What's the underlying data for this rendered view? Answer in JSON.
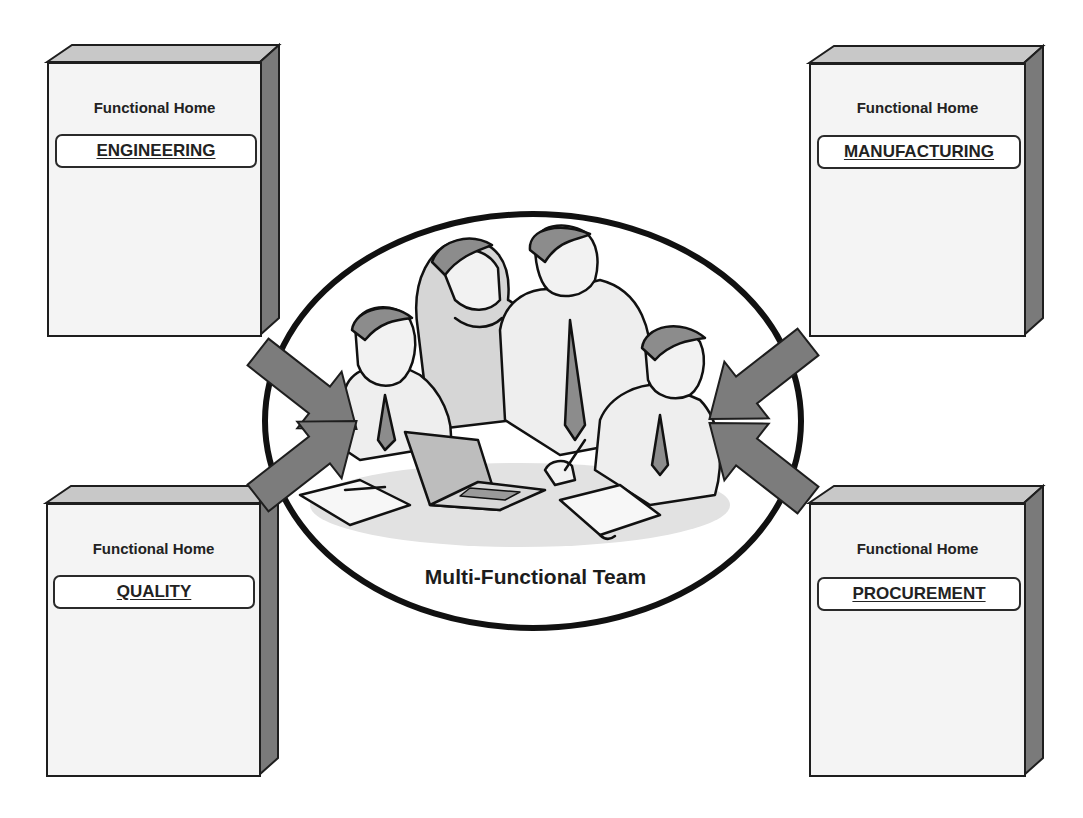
{
  "diagram": {
    "center": {
      "label": "Multi-Functional Team",
      "illustration": "team-meeting-clipart"
    },
    "functional_homes": [
      {
        "position": "top-left",
        "caption": "Functional Home",
        "department": "ENGINEERING"
      },
      {
        "position": "top-right",
        "caption": "Functional Home",
        "department": "MANUFACTURING"
      },
      {
        "position": "bottom-left",
        "caption": "Functional Home",
        "department": "QUALITY"
      },
      {
        "position": "bottom-right",
        "caption": "Functional Home",
        "department": "PROCUREMENT"
      }
    ],
    "arrows": [
      {
        "from": "ENGINEERING",
        "to": "Multi-Functional Team"
      },
      {
        "from": "MANUFACTURING",
        "to": "Multi-Functional Team"
      },
      {
        "from": "QUALITY",
        "to": "Multi-Functional Team"
      },
      {
        "from": "PROCUREMENT",
        "to": "Multi-Functional Team"
      }
    ],
    "colors": {
      "box_front": "#f4f4f4",
      "box_top": "#c8c8c8",
      "box_side": "#7a7a7a",
      "arrow_fill": "#7c7c7c",
      "outline": "#1e1e1e"
    }
  }
}
